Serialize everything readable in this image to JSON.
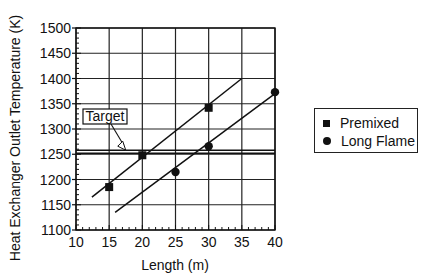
{
  "chart_data": {
    "type": "scatter",
    "title": "",
    "xlabel": "Length (m)",
    "ylabel": "Heat Exchanger Outlet Temperature (K)",
    "xlim": [
      10,
      40
    ],
    "ylim": [
      1100,
      1500
    ],
    "x_ticks": [
      10,
      15,
      20,
      25,
      30,
      35,
      40
    ],
    "y_ticks": [
      1100,
      1150,
      1200,
      1250,
      1300,
      1350,
      1400,
      1450,
      1500
    ],
    "grid": true,
    "legend_position": "right",
    "series": [
      {
        "name": "Premixed",
        "marker": "square",
        "points": [
          [
            15,
            1185
          ],
          [
            20,
            1248
          ],
          [
            30,
            1342
          ]
        ],
        "fit_line": [
          [
            12.4,
            1165
          ],
          [
            35,
            1400
          ]
        ]
      },
      {
        "name": "Long Flame",
        "marker": "circle",
        "points": [
          [
            25,
            1215
          ],
          [
            30,
            1266
          ],
          [
            40,
            1373
          ]
        ],
        "fit_line": [
          [
            15.9,
            1135
          ],
          [
            40,
            1370
          ]
        ]
      }
    ],
    "annotations": [
      {
        "text": "Target",
        "type": "horizontal_double_line",
        "y": 1255,
        "arrow_to": [
          17.5,
          1258
        ]
      }
    ]
  },
  "legend": {
    "items": [
      {
        "label": "Premixed",
        "marker": "square"
      },
      {
        "label": "Long Flame",
        "marker": "circle"
      }
    ]
  }
}
